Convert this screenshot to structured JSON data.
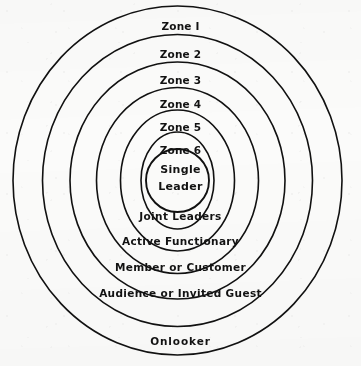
{
  "figure": {
    "type": "concentric-zone-diagram",
    "ring_count": 7,
    "stroke_color": "#111111",
    "background_color": "#fbfbfa",
    "text_color": "#121212"
  },
  "zone_labels": [
    {
      "id": "zone-1",
      "text": "Zone I",
      "y": 21,
      "ring": 1
    },
    {
      "id": "zone-2",
      "text": "Zone 2",
      "y": 49,
      "ring": 2
    },
    {
      "id": "zone-3",
      "text": "Zone 3",
      "y": 75,
      "ring": 3
    },
    {
      "id": "zone-4",
      "text": "Zone 4",
      "y": 99,
      "ring": 4
    },
    {
      "id": "zone-5",
      "text": "Zone 5",
      "y": 122,
      "ring": 5
    },
    {
      "id": "zone-6",
      "text": "Zone 6",
      "y": 145,
      "ring": 6
    }
  ],
  "core_labels": [
    {
      "id": "core-line-1",
      "text": "Single",
      "y": 164
    },
    {
      "id": "core-line-2",
      "text": "Leader",
      "y": 181
    }
  ],
  "role_labels": [
    {
      "id": "role-joint-leaders",
      "text": "Joint Leaders",
      "y": 211,
      "ring": 6
    },
    {
      "id": "role-active-functionary",
      "text": "Active Functionary",
      "y": 236,
      "ring": 5
    },
    {
      "id": "role-member-customer",
      "text": "Member or Customer",
      "y": 262,
      "ring": 4
    },
    {
      "id": "role-audience-guest",
      "text": "Audience or Invited  Guest",
      "y": 288,
      "ring": 3
    },
    {
      "id": "role-onlooker",
      "text": "Onlooker",
      "y": 336,
      "ring": 2
    }
  ],
  "rings": [
    {
      "index": 1,
      "name": "outer-ring",
      "cx": 177.5,
      "cy": 180.5,
      "rx": 164.5,
      "ry": 174.5
    },
    {
      "index": 2,
      "name": "ring-2",
      "cx": 177.5,
      "cy": 180.5,
      "rx": 135.0,
      "ry": 146.0
    },
    {
      "index": 3,
      "name": "ring-3",
      "cx": 177.5,
      "cy": 180.5,
      "rx": 107.5,
      "ry": 118.5
    },
    {
      "index": 4,
      "name": "ring-4",
      "cx": 177.5,
      "cy": 180.5,
      "rx": 81.0,
      "ry": 93.0
    },
    {
      "index": 5,
      "name": "ring-5",
      "cx": 177.5,
      "cy": 180.5,
      "rx": 57.0,
      "ry": 70.5
    },
    {
      "index": 6,
      "name": "ring-6",
      "cx": 177.5,
      "cy": 180.5,
      "rx": 36.5,
      "ry": 48.5
    },
    {
      "index": 7,
      "name": "core-circle",
      "cx": 177.5,
      "cy": 180.5,
      "rx": 31.5,
      "ry": 31.5
    }
  ]
}
